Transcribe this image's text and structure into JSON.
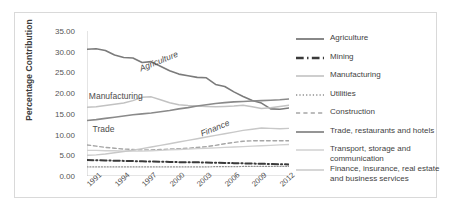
{
  "chart_data": {
    "type": "line",
    "title": "",
    "subtitle": "",
    "xlabel": "",
    "ylabel": "Percentage Contribution",
    "ylim": [
      0,
      35
    ],
    "ytick_labels": [
      "0.00",
      "5.00",
      "10.00",
      "15.00",
      "20.00",
      "25.00",
      "30.00",
      "35.00"
    ],
    "ytick_values": [
      0,
      5,
      10,
      15,
      20,
      25,
      30,
      35
    ],
    "grid": false,
    "legend_position": "right",
    "xlim": [
      1991,
      2013
    ],
    "x": [
      1991,
      1992,
      1993,
      1994,
      1995,
      1996,
      1997,
      1998,
      1999,
      2000,
      2001,
      2002,
      2003,
      2004,
      2005,
      2006,
      2007,
      2008,
      2009,
      2010,
      2011,
      2012,
      2013
    ],
    "xtick_labels": [
      "1991",
      "1994",
      "1997",
      "2000",
      "2003",
      "2006",
      "2009",
      "2012"
    ],
    "xtick_values": [
      1991,
      1994,
      1997,
      2000,
      2003,
      2006,
      2009,
      2012
    ],
    "series": [
      {
        "name": "Agriculture",
        "style": "solid",
        "color": "#7b7b7b",
        "width": 1.6,
        "values": [
          30.6,
          30.7,
          30.3,
          29.2,
          28.6,
          28.5,
          27.4,
          27.6,
          26.5,
          25.4,
          24.6,
          24.2,
          23.8,
          23.7,
          22.1,
          21.6,
          20.3,
          19.2,
          18.2,
          17.6,
          16.2,
          16.1,
          16.4
        ]
      },
      {
        "name": "Mining",
        "style": "dashdot",
        "color": "#3a3a3a",
        "width": 2.0,
        "values": [
          3.85,
          3.8,
          3.75,
          3.7,
          3.65,
          3.6,
          3.55,
          3.5,
          3.45,
          3.4,
          3.35,
          3.3,
          3.3,
          3.25,
          3.2,
          3.15,
          3.1,
          3.05,
          3.0,
          2.95,
          2.9,
          2.85,
          2.8
        ]
      },
      {
        "name": "Manufacturing",
        "style": "solid",
        "color": "#c2c2c2",
        "width": 1.5,
        "values": [
          16.6,
          16.7,
          17.0,
          17.3,
          17.6,
          18.2,
          19.0,
          19.1,
          18.4,
          17.7,
          17.2,
          17.0,
          16.9,
          16.8,
          16.7,
          16.8,
          16.9,
          17.1,
          16.7,
          16.3,
          16.5,
          16.8,
          17.1
        ]
      },
      {
        "name": "Utilities",
        "style": "dotted",
        "color": "#8f8f8f",
        "width": 1.2,
        "values": [
          2.2,
          2.2,
          2.2,
          2.2,
          2.2,
          2.2,
          2.2,
          2.2,
          2.2,
          2.2,
          2.2,
          2.2,
          2.2,
          2.2,
          2.25,
          2.25,
          2.25,
          2.3,
          2.3,
          2.3,
          2.3,
          2.3,
          2.3
        ]
      },
      {
        "name": "Construction",
        "style": "dashed",
        "color": "#a6a6a6",
        "width": 1.4,
        "values": [
          7.5,
          7.2,
          6.9,
          6.7,
          6.5,
          6.4,
          6.3,
          6.3,
          6.4,
          6.5,
          6.6,
          6.7,
          6.9,
          7.1,
          7.4,
          7.8,
          8.1,
          8.4,
          8.5,
          8.5,
          8.5,
          8.5,
          8.5
        ]
      },
      {
        "name": "Trade, restaurants and hotels",
        "style": "solid",
        "color": "#8a8a8a",
        "width": 1.6,
        "values": [
          13.4,
          13.6,
          13.9,
          14.2,
          14.5,
          14.8,
          15.0,
          15.2,
          15.5,
          15.8,
          16.2,
          16.5,
          16.9,
          17.2,
          17.5,
          17.7,
          17.9,
          18.0,
          18.1,
          18.2,
          18.3,
          18.4,
          18.6
        ]
      },
      {
        "name": "Transport, storage and communication",
        "style": "solid",
        "color": "#d0d0d0",
        "width": 1.3,
        "values": [
          6.2,
          6.2,
          6.1,
          6.1,
          6.0,
          6.0,
          6.0,
          6.1,
          6.2,
          6.3,
          6.4,
          6.5,
          6.6,
          6.7,
          6.8,
          6.9,
          7.0,
          7.1,
          7.2,
          7.3,
          7.4,
          7.5,
          7.6
        ]
      },
      {
        "name": "Finance, insurance, real estate and business services",
        "style": "solid",
        "color": "#c8c8c8",
        "width": 1.4,
        "values": [
          5.0,
          5.1,
          5.3,
          5.6,
          5.9,
          6.2,
          6.6,
          7.0,
          7.4,
          7.8,
          8.2,
          8.6,
          9.0,
          9.4,
          9.8,
          10.2,
          10.6,
          11.0,
          11.3,
          11.6,
          11.5,
          11.4,
          11.5
        ]
      }
    ],
    "annotations": [
      {
        "text": "Agriculture",
        "x": 1996.5,
        "y": 27.0,
        "rotation": -22
      },
      {
        "text": "Manufacturing",
        "x": 1991.2,
        "y": 20.6,
        "rotation": 0
      },
      {
        "text": "Trade",
        "x": 1991.6,
        "y": 12.6,
        "rotation": 0
      },
      {
        "text": "Finance",
        "x": 2003.2,
        "y": 11.4,
        "rotation": -22
      }
    ]
  },
  "legend": {
    "items": [
      {
        "label": "Agriculture",
        "style": "solid",
        "color": "#7b7b7b",
        "width": 1.8
      },
      {
        "label": "Mining",
        "style": "dashdot",
        "color": "#3a3a3a",
        "width": 2.4
      },
      {
        "label": "Manufacturing",
        "style": "solid",
        "color": "#c2c2c2",
        "width": 1.6
      },
      {
        "label": "Utilities",
        "style": "dotted",
        "color": "#8f8f8f",
        "width": 1.4
      },
      {
        "label": "Construction",
        "style": "dashed",
        "color": "#a6a6a6",
        "width": 1.6
      },
      {
        "label": "Trade, restaurants and hotels",
        "style": "solid",
        "color": "#8a8a8a",
        "width": 1.8
      },
      {
        "label": "Transport, storage and communication",
        "style": "solid",
        "color": "#d0d0d0",
        "width": 1.5
      },
      {
        "label": "Finance, insurance, real estate and business services",
        "style": "solid",
        "color": "#c8c8c8",
        "width": 1.5
      }
    ]
  },
  "colors": {
    "axis": "#bdbdbd",
    "frame": "#d9d9d9",
    "tick_text": "#4a4a4a",
    "axis_title": "#3b3b3b",
    "background": "#ffffff"
  }
}
